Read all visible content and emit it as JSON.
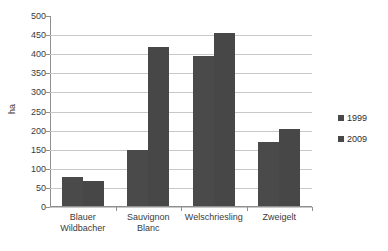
{
  "chart_data": {
    "type": "bar",
    "title": "",
    "xlabel": "",
    "ylabel": "ha",
    "ylim": [
      0,
      500
    ],
    "ytick_step": 50,
    "yticks": [
      500,
      450,
      400,
      350,
      300,
      250,
      200,
      150,
      100,
      50,
      0
    ],
    "grid": "horizontal",
    "legend_position": "right",
    "categories": [
      "Blauer Wildbacher",
      "Sauvignon Blanc",
      "Welschriesling",
      "Zweigelt"
    ],
    "category_lines": [
      [
        "Blauer",
        "Wildbacher"
      ],
      [
        "Sauvignon",
        "Blanc"
      ],
      [
        "Welschriesling"
      ],
      [
        "Zweigelt"
      ]
    ],
    "series": [
      {
        "name": "1999",
        "color": "#4a4a4a",
        "values": [
          77,
          147,
          392,
          167
        ]
      },
      {
        "name": "2009",
        "color": "#474747",
        "values": [
          65,
          416,
          454,
          201
        ]
      }
    ]
  },
  "legend": {
    "items": [
      {
        "label": "1999"
      },
      {
        "label": "2009"
      }
    ]
  },
  "axis": {
    "y_label": "ha"
  },
  "title_remnant": ""
}
